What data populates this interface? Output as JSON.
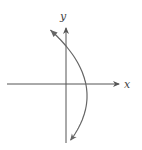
{
  "diagram": {
    "type": "coordinate-graph",
    "axes": {
      "x_label": "x",
      "y_label": "y"
    },
    "curve": {
      "kind": "parabola",
      "orientation": "opens-left",
      "equation_form": "x = -a(y - k)^2 + h",
      "vertex_quadrant": "IV",
      "x_intercepts": 1,
      "y_intercepts": 2,
      "arrows_at_ends": true
    },
    "colors": {
      "axis": "#555555",
      "curve": "#666666",
      "label": "#444444"
    }
  }
}
